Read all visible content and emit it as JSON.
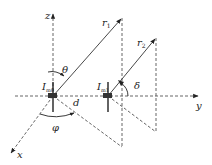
{
  "diagram": {
    "type": "antenna-array-geometry",
    "colors": {
      "line": "#333333",
      "dash": "#555555",
      "background": "#ffffff"
    },
    "axes": {
      "x": {
        "label": "x"
      },
      "y": {
        "label": "y"
      },
      "z": {
        "label": "z"
      }
    },
    "elements": [
      {
        "label": "I",
        "subscript": "m0"
      },
      {
        "label": "I",
        "subscript": "m1"
      }
    ],
    "vectors": [
      {
        "label": "r",
        "subscript": "1"
      },
      {
        "label": "r",
        "subscript": "2"
      }
    ],
    "angles": {
      "theta": "θ",
      "phi": "φ",
      "delta": "δ"
    },
    "distance": {
      "label": "d"
    }
  }
}
